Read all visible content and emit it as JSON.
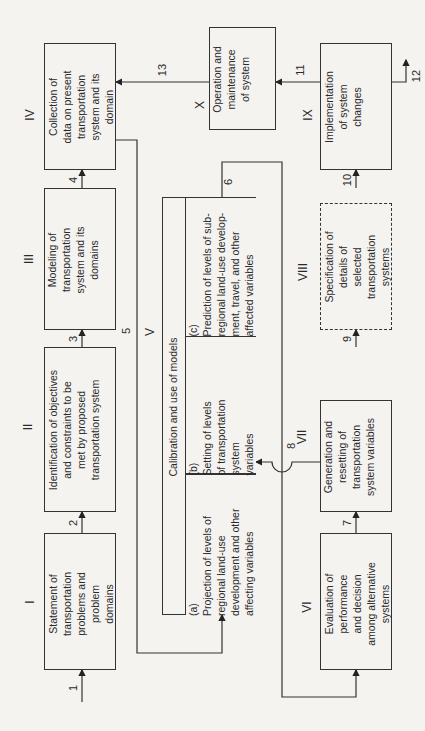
{
  "diagram": {
    "orientation": "rotated -90deg",
    "stages": [
      {
        "id": "I",
        "label": "Statement of\ntransportation\nproblems and\nproblem\ndomains"
      },
      {
        "id": "II",
        "label": "Identification of objectives\nand constraints to be\nmet by proposed\ntransportation system"
      },
      {
        "id": "III",
        "label": "Modeling of\ntransportation\nsystem and its\ndomains"
      },
      {
        "id": "IV",
        "label": "Collection of\ndata on present\ntransportation\nsystem and its\ndomain"
      },
      {
        "id": "V",
        "label": "Calibration and use of models",
        "parts": [
          {
            "id": "(a)",
            "label": "Projection of levels of\nregional land-use\ndevelopment and other\naffecting variables"
          },
          {
            "id": "(b)",
            "label": "Setting of levels\nof transportation\nsystem\nvariables"
          },
          {
            "id": "(c)",
            "label": "Prediction of levels of sub-\nregional land-use develop-\nment, travel, and other\naffected variables"
          }
        ]
      },
      {
        "id": "VI",
        "label": "Evaluation of\nperformance\nand decision\namong alternative\nsystems"
      },
      {
        "id": "VII",
        "label": "Generation and\nresetting of\ntransportation\nsystem variables"
      },
      {
        "id": "VIII",
        "label": "Specification of\ndetails of\nselected\ntransportation\nsystems",
        "style": "dashed"
      },
      {
        "id": "IX",
        "label": "Implementation\nof system\nchanges"
      },
      {
        "id": "X",
        "label": "Operation and\nmaintenance\nof system"
      }
    ],
    "flows": [
      "1",
      "2",
      "3",
      "4",
      "5",
      "6",
      "7",
      "8",
      "9",
      "10",
      "11",
      "12",
      "13"
    ]
  }
}
